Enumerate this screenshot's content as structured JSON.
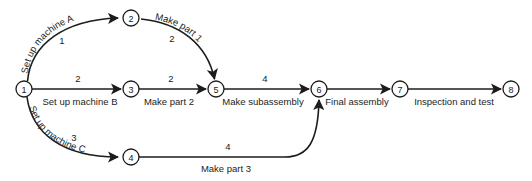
{
  "diagram": {
    "type": "activity-on-arrow-network",
    "title": "",
    "background_color": "#ffffff",
    "line_color": "#1c1c1c",
    "nodes": [
      {
        "id": "1",
        "label": "1",
        "cx": 24,
        "cy": 89
      },
      {
        "id": "2",
        "label": "2",
        "cx": 131,
        "cy": 18
      },
      {
        "id": "3",
        "label": "3",
        "cx": 131,
        "cy": 89
      },
      {
        "id": "4",
        "label": "4",
        "cx": 131,
        "cy": 157
      },
      {
        "id": "5",
        "label": "5",
        "cx": 216,
        "cy": 89
      },
      {
        "id": "6",
        "label": "6",
        "cx": 319,
        "cy": 89
      },
      {
        "id": "7",
        "label": "7",
        "cx": 400,
        "cy": 89
      },
      {
        "id": "8",
        "label": "8",
        "cx": 511,
        "cy": 89
      }
    ],
    "edges": [
      {
        "id": "e1",
        "from": "1",
        "to": "2",
        "activity": "Set up machine A",
        "duration": "1",
        "shape": "curve-up",
        "label_orientation": "rotated-along-arc"
      },
      {
        "id": "e2",
        "from": "2",
        "to": "5",
        "activity": "Make part 1",
        "duration": "2",
        "shape": "curve-down",
        "label_orientation": "rotated-along-arc"
      },
      {
        "id": "e3",
        "from": "1",
        "to": "3",
        "activity": "Set up machine B",
        "duration": "2",
        "shape": "straight",
        "label_orientation": "horizontal"
      },
      {
        "id": "e4",
        "from": "3",
        "to": "5",
        "activity": "Make part 2",
        "duration": "2",
        "shape": "straight",
        "label_orientation": "horizontal"
      },
      {
        "id": "e5",
        "from": "1",
        "to": "4",
        "activity": "Set up machine C",
        "duration": "3",
        "shape": "curve-down",
        "label_orientation": "rotated-along-arc"
      },
      {
        "id": "e6",
        "from": "4",
        "to": "6",
        "activity": "Make part 3",
        "duration": "4",
        "shape": "curve-up-right",
        "label_orientation": "horizontal"
      },
      {
        "id": "e7",
        "from": "5",
        "to": "6",
        "activity": "Make subassembly",
        "duration": "4",
        "shape": "straight",
        "label_orientation": "horizontal"
      },
      {
        "id": "e8",
        "from": "6",
        "to": "7",
        "activity": "Final assembly",
        "duration": "",
        "shape": "straight",
        "label_orientation": "horizontal"
      },
      {
        "id": "e9",
        "from": "7",
        "to": "8",
        "activity": "Inspection and test",
        "duration": "",
        "shape": "straight",
        "label_orientation": "horizontal"
      }
    ]
  }
}
